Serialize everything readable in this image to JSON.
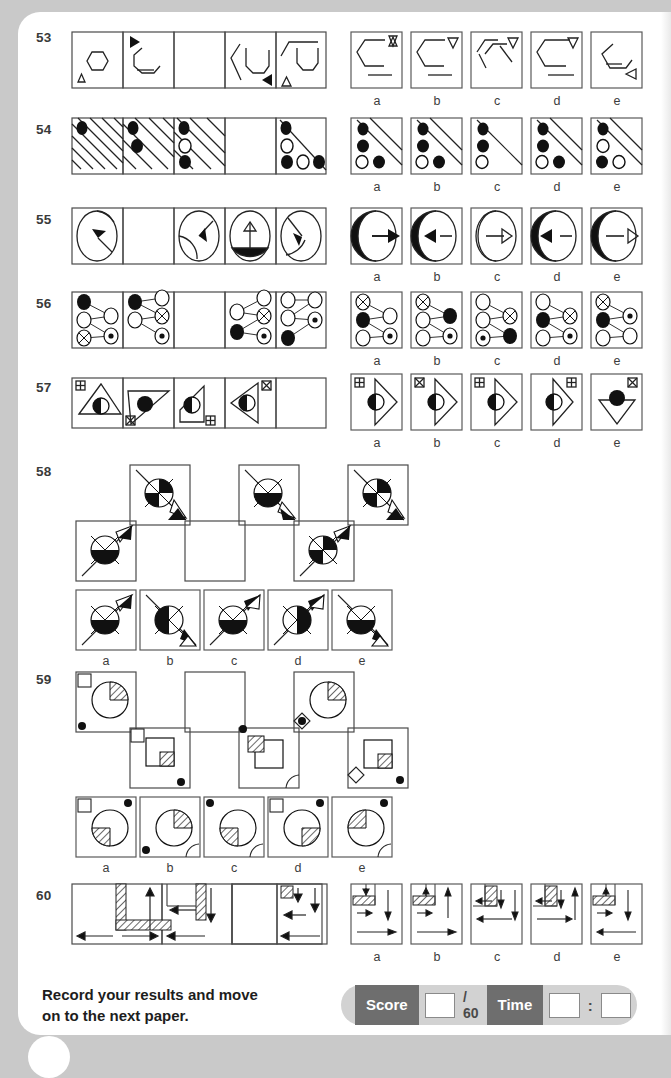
{
  "page": {
    "kind": "non-verbal-reasoning-test-page",
    "background_color": "#c9c9c9",
    "sheet_color": "#ffffff"
  },
  "footer": {
    "instruction_line1": "Record your results and move",
    "instruction_line2": "on to the next paper.",
    "score_label": "Score",
    "score_value": "",
    "score_total": "/ 60",
    "time_label": "Time",
    "time_minutes": "",
    "time_colon": ":",
    "time_seconds": "",
    "label_bg": "#6e6e6e",
    "bar_bg": "#d2d2d2"
  },
  "option_letters": [
    "a",
    "b",
    "c",
    "d",
    "e"
  ],
  "questions": [
    {
      "number": "53",
      "type": "series-with-blank",
      "sequence_cells": 5,
      "blank_cell_index": 2,
      "description": "Hexagon outlines progressively broken, with small triangle markers",
      "options": [
        "a",
        "b",
        "c",
        "d",
        "e"
      ]
    },
    {
      "number": "54",
      "type": "series-with-blank",
      "sequence_cells": 5,
      "blank_cell_index": 3,
      "description": "Diagonal hatch stripes with filled and open circles",
      "options": [
        "a",
        "b",
        "c",
        "d",
        "e"
      ]
    },
    {
      "number": "55",
      "type": "series-with-blank",
      "sequence_cells": 5,
      "blank_cell_index": 1,
      "description": "Circles with arrows and shaded segments",
      "options": [
        "a",
        "b",
        "c",
        "d",
        "e"
      ]
    },
    {
      "number": "56",
      "type": "series-with-blank",
      "sequence_cells": 5,
      "blank_cell_index": 2,
      "description": "Three-node connection diagrams with filled, open and crossed circles",
      "options": [
        "a",
        "b",
        "c",
        "d",
        "e"
      ]
    },
    {
      "number": "57",
      "type": "series-with-blank",
      "sequence_cells": 5,
      "blank_cell_index": 4,
      "description": "Triangles with half-shaded circle and corner marker squares",
      "options": [
        "a",
        "b",
        "c",
        "d",
        "e"
      ]
    },
    {
      "number": "58",
      "type": "matrix-with-blank",
      "grid_rows": 2,
      "grid_cols": 3,
      "blank_cell": "row2-col2",
      "description": "Crossed circles on a diagonal line with double arrowheads",
      "options": [
        "a",
        "b",
        "c",
        "d",
        "e"
      ]
    },
    {
      "number": "59",
      "type": "matrix-with-blank",
      "grid_rows": 2,
      "grid_cols": 3,
      "blank_cell": "row1-col2",
      "description": "Pie circles and hatched squares with corner dots",
      "options": [
        "a",
        "b",
        "c",
        "d",
        "e"
      ]
    },
    {
      "number": "60",
      "type": "series-with-blank",
      "sequence_cells": 4,
      "blank_cell_index": 2,
      "description": "Hatched L-blocks with directional arrows",
      "options": [
        "a",
        "b",
        "c",
        "d",
        "e"
      ]
    }
  ]
}
